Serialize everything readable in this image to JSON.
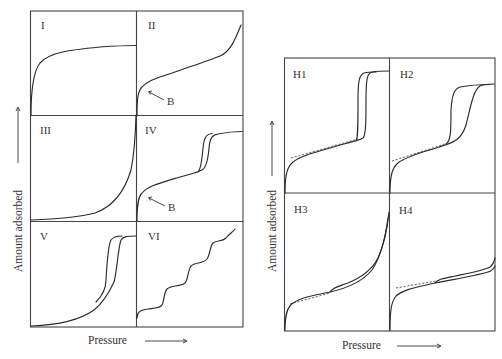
{
  "figure": {
    "left_grid": {
      "name": "IUPAC physisorption isotherm types",
      "panels": [
        {
          "id": "I",
          "label": "I",
          "shape": "rapid rise then plateau"
        },
        {
          "id": "II",
          "label": "II",
          "shape": "monolayer knee at B then multilayer rise",
          "annotation": "B"
        },
        {
          "id": "III",
          "label": "III",
          "shape": "convex throughout"
        },
        {
          "id": "IV",
          "label": "IV",
          "shape": "knee at B, capillary condensation step with hysteresis loop, plateau",
          "annotation": "B"
        },
        {
          "id": "V",
          "label": "V",
          "shape": "convex start, step with hysteresis loop, plateau"
        },
        {
          "id": "VI",
          "label": "VI",
          "shape": "stepwise multilayer adsorption"
        }
      ],
      "x_axis_label": "Pressure",
      "y_axis_label": "Amount adsorbed"
    },
    "right_grid": {
      "name": "Hysteresis loop types",
      "panels": [
        {
          "id": "H1",
          "label": "H1",
          "shape": "narrow vertical parallel branches"
        },
        {
          "id": "H2",
          "label": "H2",
          "shape": "broad triangular loop"
        },
        {
          "id": "H3",
          "label": "H3",
          "shape": "loop without limiting adsorption at high pressure"
        },
        {
          "id": "H4",
          "label": "H4",
          "shape": "narrow near-horizontal parallel branches"
        }
      ],
      "x_axis_label": "Pressure",
      "y_axis_label": "Amount adsorbed"
    },
    "annotation_text": "B",
    "colors": {
      "line": "#2a2a2a",
      "frame": "#444444",
      "background": "#ffffff"
    }
  }
}
